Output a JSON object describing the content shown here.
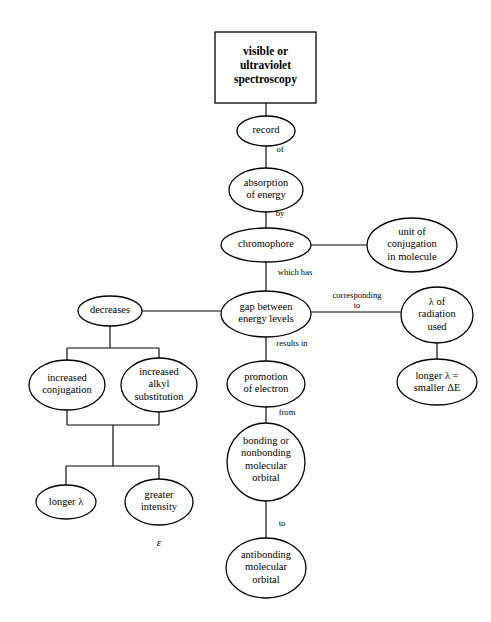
{
  "diagram": {
    "type": "concept-map",
    "title_box": {
      "label": "visible or\nultraviolet\nspectroscopy",
      "shape": "rectangle",
      "x": 215,
      "y": 32,
      "w": 101,
      "h": 71
    },
    "stroke_color": "#000000",
    "fill_color": "#ffffff",
    "background_color": "#ffffff",
    "nodes": [
      {
        "id": "record",
        "label": "record",
        "shape": "ellipse",
        "cx": 266,
        "cy": 131,
        "rx": 29,
        "ry": 15
      },
      {
        "id": "absorption",
        "label": "absorption\nof energy",
        "shape": "ellipse",
        "cx": 266,
        "cy": 190,
        "rx": 37,
        "ry": 22
      },
      {
        "id": "chromophore",
        "label": "chromophore",
        "shape": "ellipse",
        "cx": 266,
        "cy": 245,
        "rx": 45,
        "ry": 17
      },
      {
        "id": "unit",
        "label": "unit of\nconjugation\nin molecule",
        "shape": "ellipse",
        "cx": 412,
        "cy": 245,
        "rx": 45,
        "ry": 27
      },
      {
        "id": "gap",
        "label": "gap between\nenergy levels",
        "shape": "ellipse",
        "cx": 266,
        "cy": 314,
        "rx": 45,
        "ry": 23
      },
      {
        "id": "decreases",
        "label": "decreases",
        "shape": "ellipse",
        "cx": 110,
        "cy": 311,
        "rx": 32,
        "ry": 15
      },
      {
        "id": "lambda_rad",
        "label": "λ of\nradiation\nused",
        "shape": "ellipse",
        "cx": 437,
        "cy": 315,
        "rx": 36,
        "ry": 28
      },
      {
        "id": "longer_dE",
        "label": "longer λ =\nsmaller ΔE",
        "shape": "ellipse",
        "cx": 437,
        "cy": 382,
        "rx": 40,
        "ry": 23
      },
      {
        "id": "inc_conj",
        "label": "increased\nconjugation",
        "shape": "ellipse",
        "cx": 67,
        "cy": 385,
        "rx": 38,
        "ry": 25
      },
      {
        "id": "inc_alkyl",
        "label": "increased\nalkyl\nsubstitution",
        "shape": "ellipse",
        "cx": 159,
        "cy": 385,
        "rx": 38,
        "ry": 27
      },
      {
        "id": "longer_lambda",
        "label": "longer λ",
        "shape": "ellipse",
        "cx": 66,
        "cy": 502,
        "rx": 30,
        "ry": 17
      },
      {
        "id": "greater_int",
        "label": "greater\nintensity",
        "shape": "ellipse",
        "cx": 159,
        "cy": 502,
        "rx": 34,
        "ry": 23
      },
      {
        "id": "promotion",
        "label": "promotion\nof electron",
        "shape": "ellipse",
        "cx": 266,
        "cy": 384,
        "rx": 39,
        "ry": 23
      },
      {
        "id": "bonding",
        "label": "bonding or\nnonbonding\nmolecular\norbital",
        "shape": "ellipse",
        "cx": 266,
        "cy": 462,
        "rx": 39,
        "ry": 39
      },
      {
        "id": "antibonding",
        "label": "antibonding\nmolecular\norbital",
        "shape": "ellipse",
        "cx": 266,
        "cy": 568,
        "rx": 40,
        "ry": 30
      }
    ],
    "edges": [
      {
        "from": "title_box",
        "to": "record",
        "label": "",
        "label_x": 266,
        "label_y": 110
      },
      {
        "from": "record",
        "to": "absorption",
        "label": "of",
        "label_x": 280,
        "label_y": 150
      },
      {
        "from": "absorption",
        "to": "chromophore",
        "label": "by",
        "label_x": 280,
        "label_y": 214
      },
      {
        "from": "chromophore",
        "to": "unit",
        "label": "",
        "label_x": 340,
        "label_y": 236
      },
      {
        "from": "chromophore",
        "to": "gap",
        "label": "which has",
        "label_x": 294,
        "label_y": 273
      },
      {
        "from": "gap",
        "to": "decreases",
        "label": "",
        "label_x": 186,
        "label_y": 303
      },
      {
        "from": "gap",
        "to": "lambda_rad",
        "label": "corresponding\nto",
        "label_x": 357,
        "label_y": 297
      },
      {
        "from": "lambda_rad",
        "to": "longer_dE",
        "label": "",
        "label_x": 437,
        "label_y": 352
      },
      {
        "from": "gap",
        "to": "promotion",
        "label": "results in",
        "label_x": 292,
        "label_y": 344
      },
      {
        "from": "promotion",
        "to": "bonding",
        "label": "from",
        "label_x": 287,
        "label_y": 413
      },
      {
        "from": "bonding",
        "to": "antibonding",
        "label": "to",
        "label_x": 281,
        "label_y": 524
      },
      {
        "from": "decreases",
        "to": "inc_conj",
        "label": "",
        "label_x": 0,
        "label_y": 0
      },
      {
        "from": "decreases",
        "to": "inc_alkyl",
        "label": "",
        "label_x": 0,
        "label_y": 0
      },
      {
        "from": "inc_conj",
        "to": "longer_lambda",
        "label": "",
        "label_x": 0,
        "label_y": 0
      },
      {
        "from": "inc_alkyl",
        "to": "greater_int",
        "label": "",
        "label_x": 0,
        "label_y": 0
      }
    ],
    "free_symbols": [
      {
        "id": "epsilon",
        "label": "ε",
        "x": 159,
        "y": 545
      }
    ]
  }
}
